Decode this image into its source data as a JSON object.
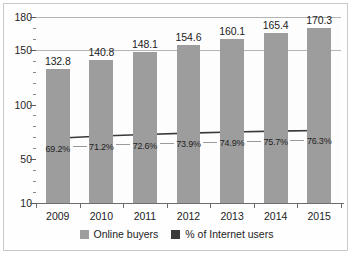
{
  "chart_data": {
    "type": "bar",
    "title": "",
    "subtitle": "",
    "xlabel": "",
    "ylabel": "",
    "categories": [
      "2009",
      "2010",
      "2011",
      "2012",
      "2013",
      "2014",
      "2015"
    ],
    "ylim": [
      10,
      180
    ],
    "yticks": [
      "180",
      "150",
      "100",
      "50",
      "10"
    ],
    "ytick_values": [
      180,
      150,
      100,
      50,
      10
    ],
    "minor_ticks": true,
    "grid": true,
    "grid_axis": "y",
    "legend_position": "bottom-center",
    "series": [
      {
        "name": "Online buyers",
        "type": "bar",
        "color": "#9d9d9d",
        "values": [
          132.8,
          140.8,
          148.1,
          154.6,
          160.1,
          165.4,
          170.3
        ],
        "labels": [
          "132.8",
          "140.8",
          "148.1",
          "154.6",
          "160.1",
          "165.4",
          "170.3"
        ]
      },
      {
        "name": "% of Internet users",
        "type": "line",
        "color": "#3a3a3a",
        "values": [
          69.2,
          71.2,
          72.6,
          73.9,
          74.9,
          75.7,
          76.3
        ],
        "labels": [
          "69.2%",
          "71.2%",
          "72.6%",
          "73.9%",
          "74.9%",
          "75.7%",
          "76.3%"
        ]
      }
    ]
  },
  "legend": {
    "items": [
      {
        "label": "Online buyers",
        "color": "#9d9d9d"
      },
      {
        "label": "% of Internet users",
        "color": "#3a3a3a"
      }
    ]
  }
}
